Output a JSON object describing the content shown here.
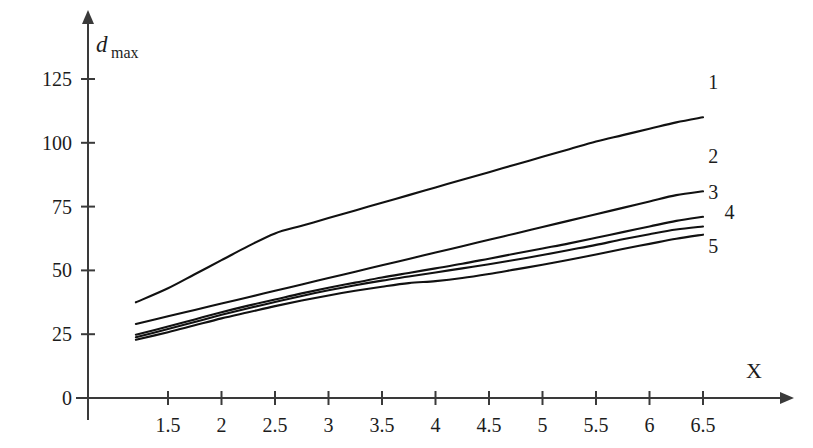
{
  "figure": {
    "background_color": "#ffffff",
    "line_color": "#111111",
    "axis_color": "#3a3a3a"
  },
  "axes": {
    "y_axis_title_main": "d",
    "y_axis_title_sub": "max",
    "x_axis_title": "Χ"
  },
  "chart_data": {
    "type": "line",
    "title": "",
    "subtitle": "",
    "xlabel": "Χ",
    "ylabel": "d_max",
    "xlim": [
      1.15,
      6.9
    ],
    "ylim": [
      0,
      138
    ],
    "grid": false,
    "legend_position": "right-end-of-curve-labels",
    "x_ticks": [
      1.5,
      2,
      2.5,
      3,
      3.5,
      4,
      4.5,
      5,
      5.5,
      6,
      6.5
    ],
    "x_tick_labels": [
      "1.5",
      "2",
      "2.5",
      "3",
      "3.5",
      "4",
      "4.5",
      "5",
      "5.5",
      "6",
      "6.5"
    ],
    "y_ticks": [
      0,
      25,
      50,
      75,
      100,
      125
    ],
    "y_tick_labels": [
      "0",
      "25",
      "50",
      "75",
      "100",
      "125"
    ],
    "x": [
      1.2,
      1.5,
      1.75,
      2.0,
      2.25,
      2.5,
      2.75,
      3.0,
      3.25,
      3.5,
      3.75,
      4.0,
      4.25,
      4.5,
      4.75,
      5.0,
      5.25,
      5.5,
      5.75,
      6.0,
      6.25,
      6.5
    ],
    "series": [
      {
        "name": "1",
        "label": "1",
        "values": [
          37.5,
          43.0,
          48.5,
          54.0,
          59.5,
          64.5,
          67.5,
          70.5,
          73.5,
          76.5,
          79.5,
          82.5,
          85.5,
          88.5,
          91.5,
          94.5,
          97.5,
          100.5,
          103.0,
          105.5,
          108.0,
          110.0
        ]
      },
      {
        "name": "2",
        "label": "2",
        "values": [
          29.0,
          32.0,
          34.5,
          37.0,
          39.5,
          42.0,
          44.5,
          47.0,
          49.5,
          52.0,
          54.5,
          57.0,
          59.5,
          62.0,
          64.5,
          67.0,
          69.5,
          72.0,
          74.5,
          77.0,
          79.5,
          81.0
        ]
      },
      {
        "name": "3",
        "label": "3",
        "values": [
          24.8,
          28.0,
          30.8,
          33.6,
          36.2,
          38.6,
          41.0,
          43.2,
          45.2,
          47.2,
          49.0,
          50.8,
          52.6,
          54.6,
          56.6,
          58.6,
          60.6,
          62.8,
          65.0,
          67.2,
          69.4,
          71.0
        ]
      },
      {
        "name": "4",
        "label": "4",
        "values": [
          23.8,
          27.0,
          29.8,
          32.6,
          35.2,
          37.6,
          40.0,
          42.2,
          44.2,
          46.0,
          47.6,
          49.2,
          50.8,
          52.4,
          54.2,
          56.0,
          58.0,
          60.0,
          62.2,
          64.2,
          66.0,
          67.2
        ]
      },
      {
        "name": "5",
        "label": "5",
        "values": [
          22.8,
          25.8,
          28.5,
          31.2,
          33.6,
          36.0,
          38.2,
          40.2,
          42.0,
          43.6,
          45.0,
          45.8,
          47.0,
          48.6,
          50.4,
          52.2,
          54.2,
          56.2,
          58.4,
          60.4,
          62.4,
          64.0
        ]
      }
    ],
    "series_label_positions": [
      {
        "label": "1",
        "x": 6.55,
        "y": 121
      },
      {
        "label": "2",
        "x": 6.55,
        "y": 92
      },
      {
        "label": "3",
        "x": 6.55,
        "y": 78
      },
      {
        "label": "4",
        "x": 6.7,
        "y": 70
      },
      {
        "label": "5",
        "x": 6.55,
        "y": 57
      }
    ]
  }
}
